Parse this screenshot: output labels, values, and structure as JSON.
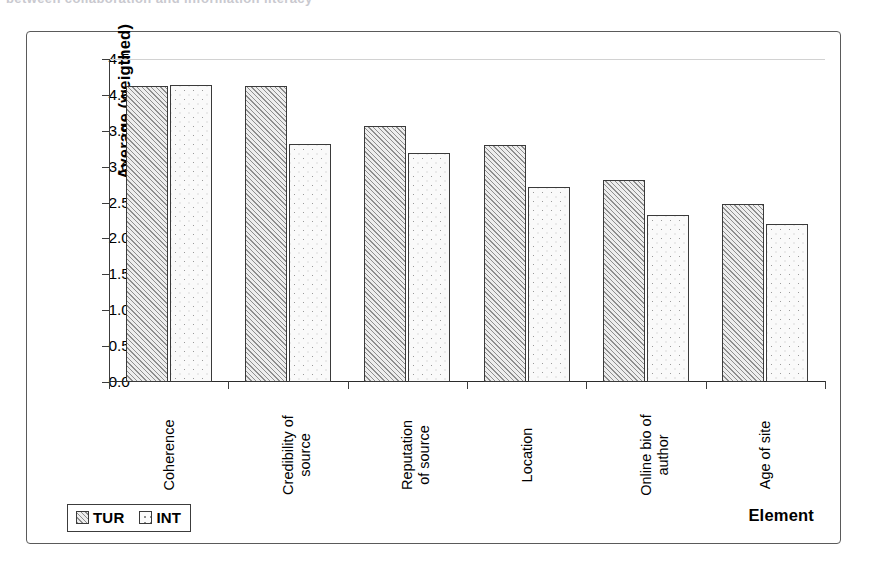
{
  "scan": {
    "top_fragment": "between collaboration and information literacy"
  },
  "chart_data": {
    "type": "bar",
    "title": "",
    "subtitle": "",
    "xlabel": "Element",
    "ylabel": "Average (weigthed)",
    "ylim": [
      0.0,
      4.5
    ],
    "ytick_labels": [
      "4.5",
      "4.0",
      "3.5",
      "3.0",
      "2.5",
      "2.0",
      "1.5",
      "1.0",
      "0.5",
      "0.0"
    ],
    "ytick_values": [
      4.5,
      4.0,
      3.5,
      3.0,
      2.5,
      2.0,
      1.5,
      1.0,
      0.5,
      0.0
    ],
    "grid": "top-gridline-only",
    "legend_position": "bottom-left",
    "categories": [
      "Coherence",
      "Credibility of\nsource",
      "Reputation\nof source",
      "Location",
      "Online bio of\nauthor",
      "Age of site"
    ],
    "series": [
      {
        "name": "TUR",
        "fill": "diagonal-hatch",
        "values": [
          4.13,
          4.12,
          3.56,
          3.3,
          2.81,
          2.48
        ]
      },
      {
        "name": "INT",
        "fill": "dotted",
        "values": [
          4.14,
          3.32,
          3.19,
          2.71,
          2.32,
          2.2
        ]
      }
    ]
  },
  "legend": {
    "entries": [
      {
        "label": "TUR",
        "swatch": "hatch-swatch-icon"
      },
      {
        "label": "INT",
        "swatch": "dot-swatch-icon"
      }
    ]
  }
}
